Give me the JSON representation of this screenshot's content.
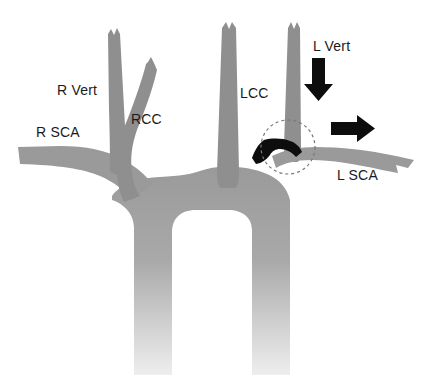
{
  "figure": {
    "background_color": "#ffffff",
    "vessel_color": "#9a9a9a",
    "vessel_color_light": "#e8e8e8",
    "lesion_color": "#0d0d0d",
    "arrow_color": "#0d0d0d",
    "dashed_circle_color": "#777777",
    "label_color": "#1a1a1a"
  },
  "labels": {
    "r_vert": "R Vert",
    "r_sca": "R SCA",
    "rcc": "RCC",
    "lcc": "LCC",
    "l_vert": "L Vert",
    "l_sca": "L SCA"
  },
  "icons": {
    "down_arrow": "down-arrow-icon",
    "right_arrow": "right-arrow-icon",
    "lesion": "stenosis-lesion-icon",
    "highlight_circle": "dashed-highlight-circle-icon"
  }
}
